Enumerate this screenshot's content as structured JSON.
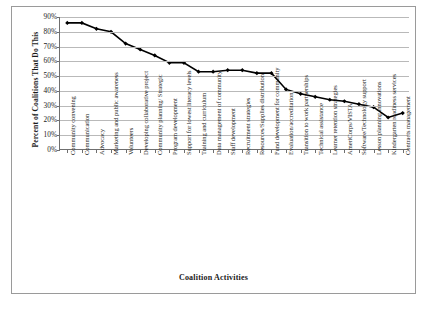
{
  "chart_data": {
    "type": "line",
    "title": "",
    "xlabel": "Coalition Activities",
    "ylabel": "Percent of Coalitions That Do This",
    "ylim": [
      0,
      90
    ],
    "ytick_labels": [
      "90%",
      "80%",
      "70%",
      "60%",
      "50%",
      "40%",
      "30%",
      "20%",
      "10%",
      "0%"
    ],
    "ytick_values": [
      90,
      80,
      70,
      60,
      50,
      40,
      30,
      20,
      10,
      0
    ],
    "grid": true,
    "legend": "none",
    "marker": "filled-diamond",
    "line_color": "#000000",
    "categories": [
      "Community convening",
      "Communication",
      "Advocacy",
      "Marketing and public awareness",
      "Volunteers",
      "Developing collaborative project",
      "Community planning/ Strategic",
      "Program development",
      "Support for lowest literacy levels",
      "Training and curriculum",
      "Data management of community",
      "Staff development",
      "Recruitment strategies",
      "Resources/Supplies distribution",
      "Fund development for community",
      "Evaluation/accreditation",
      "Transition to work partnerships",
      "Technical assistance",
      "Learner retention strategies",
      "AmeriCorps/VISTA",
      "Software/Technology support",
      "Lesson planning innovations",
      "Kindergarten readiness services",
      "Contracts management"
    ],
    "values": [
      86,
      86,
      82,
      80,
      72,
      68,
      64,
      59,
      59,
      53,
      53,
      54,
      54,
      52,
      52,
      41,
      38,
      36,
      34,
      33,
      31,
      29,
      22,
      25
    ]
  },
  "caption": {
    "text": ""
  }
}
